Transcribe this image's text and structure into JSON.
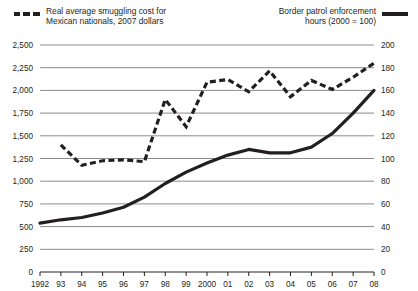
{
  "legend": {
    "left": {
      "line1": "Real average smuggling cost for",
      "line2": "Mexican nationals, 2007 dollars",
      "marker": "dashed-line-swatch"
    },
    "right": {
      "line1": "Border patrol enforcement",
      "line2": "hours (2000 = 100)",
      "marker": "solid-line-swatch"
    }
  },
  "chart_data": {
    "type": "line",
    "title": "",
    "subtitle": "",
    "xlabel": "",
    "ylabel": "",
    "grid": true,
    "legend_position": "top",
    "x": [
      1992,
      1993,
      1994,
      1995,
      1996,
      1997,
      1998,
      1999,
      2000,
      2001,
      2002,
      2003,
      2004,
      2005,
      2006,
      2007,
      2008
    ],
    "categories": [
      "1992",
      "93",
      "94",
      "95",
      "96",
      "97",
      "98",
      "99",
      "2000",
      "01",
      "02",
      "03",
      "04",
      "05",
      "06",
      "07",
      "08"
    ],
    "left_axis": {
      "label": "Real average smuggling cost for Mexican nationals, 2007 dollars",
      "ylim": [
        0,
        2500
      ],
      "ticks": [
        0,
        250,
        500,
        750,
        1000,
        1250,
        1500,
        1750,
        2000,
        2250,
        2500
      ],
      "tick_labels": [
        "0",
        "250",
        "500",
        "750",
        "1,000",
        "1,250",
        "1,500",
        "1,750",
        "2,000",
        "2,250",
        "2,500"
      ]
    },
    "right_axis": {
      "label": "Border patrol enforcement hours (2000 = 100)",
      "ylim": [
        0,
        200
      ],
      "ticks": [
        0,
        20,
        40,
        60,
        80,
        100,
        120,
        140,
        160,
        180,
        200
      ],
      "tick_labels": [
        "0",
        "20",
        "40",
        "60",
        "80",
        "100",
        "120",
        "140",
        "160",
        "180",
        "200"
      ]
    },
    "series": [
      {
        "name": "Real average smuggling cost for Mexican nationals, 2007 dollars",
        "axis": "left",
        "style": "dashed",
        "color": "#231f20",
        "x": [
          1993,
          1994,
          1995,
          1996,
          1997,
          1998,
          1999,
          2000,
          2001,
          2002,
          2003,
          2004,
          2005,
          2006,
          2007,
          2008
        ],
        "values": [
          1400,
          1175,
          1225,
          1235,
          1215,
          1900,
          1600,
          2090,
          2120,
          1985,
          2215,
          1930,
          2110,
          2010,
          2145,
          2300
        ]
      },
      {
        "name": "Border patrol enforcement hours (2000 = 100)",
        "axis": "right",
        "style": "solid",
        "color": "#231f20",
        "x": [
          1992,
          1993,
          1994,
          1995,
          1996,
          1997,
          1998,
          1999,
          2000,
          2001,
          2002,
          2003,
          2004,
          2005,
          2006,
          2007,
          2008
        ],
        "values": [
          43,
          46,
          48,
          52,
          57,
          66,
          78,
          88,
          96,
          103,
          108,
          105,
          105,
          110,
          122,
          140,
          160
        ]
      }
    ]
  }
}
